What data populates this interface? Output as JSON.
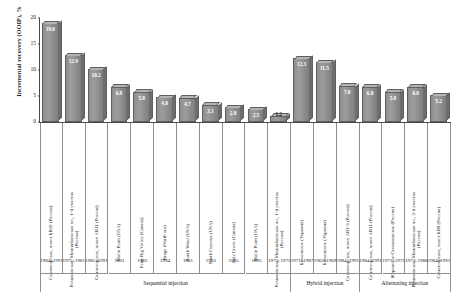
{
  "chart_data": {
    "type": "bar",
    "title": "",
    "xlabel": "",
    "ylabel": "Incremental recovery (OOIP), %",
    "ylim": [
      0,
      20
    ],
    "yticks": [
      "0",
      "5",
      "10",
      "15",
      "20"
    ],
    "grid": false,
    "legend": null,
    "categories": [
      "Самотлорское, пласт БВ10 (Россия)",
      "Романовское, Миннибаевская пл., 1-й участок (Россия)",
      "Самотлорское, пласт АВ11 (Россия)",
      "Malin Point (USA)",
      "Fenn Big Valley (Canada)",
      "Brage (North sea)",
      "South Ward (USA)",
      "South Cuyama (USA)",
      "Judy Creek (Canada)",
      "Malin Point (USA)",
      "Романовское, Миннибаевская пл., 1-й участок (Россия)",
      "Битковское (Украина)",
      "Битковское (Украина)",
      "Самотлорское, пласт АВ1-3 (Россия)",
      "Самотлорское, пласт АВ11 (Россия)",
      "Журавское-Степановское (Россия)",
      "Романовское, Миннибаевская пл., 2-й участок (Россия)",
      "Самотлорское, пласт БВ8 (Россия)"
    ],
    "values": [
      19.0,
      12.9,
      10.2,
      6.8,
      5.8,
      4.8,
      4.7,
      3.3,
      2.8,
      2.5,
      1.2,
      12.3,
      11.5,
      7.0,
      6.8,
      5.8,
      6.8,
      5.2
    ],
    "value_labels": [
      "19.0",
      "12.9",
      "10.2",
      "6.8",
      "5.8",
      "4.8",
      "4.7",
      "3.3",
      "2.8",
      "2.5",
      "1.2",
      "12.3",
      "11.5",
      "7.0",
      "6.8",
      "5.8",
      "6.8",
      "5.2"
    ],
    "dates": [
      "1984–\n1991",
      "1975–\n1981",
      "1985–\n1991",
      "2001",
      "1983",
      "1994",
      "1961",
      "1963",
      "1985",
      "1995",
      "1973–\n1975",
      "1971–\n1987",
      "1962–\n1969",
      "1984–\n1991",
      "1984–\n1991",
      "1971–\n1975",
      "1973–\n1988",
      "1984–\n1991"
    ],
    "groups": [
      {
        "label": "Sequential injection",
        "start": 0,
        "count": 11
      },
      {
        "label": "Hybrid injection",
        "start": 11,
        "count": 3
      },
      {
        "label": "Alternating injection",
        "start": 14,
        "count": 4
      }
    ],
    "bar_color": "#8f8f8f",
    "axis_color": "#4a4a4a",
    "value_label_color": "#ffffff"
  }
}
